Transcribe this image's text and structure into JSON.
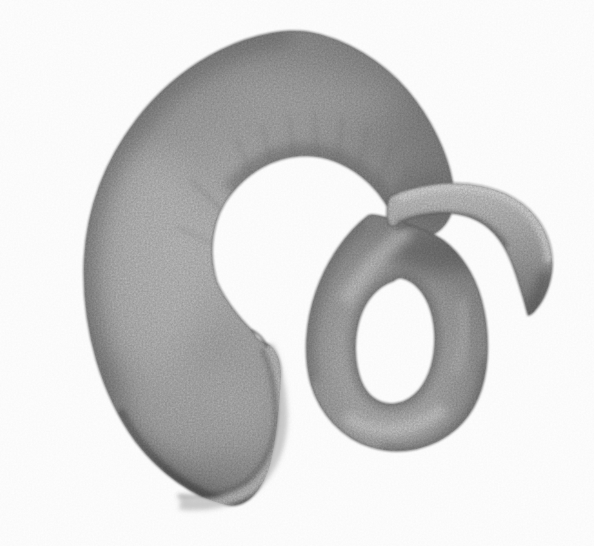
{
  "image": {
    "medium": "graphite pencil drawing on white paper",
    "subject": "Pencil drawing of a thick coiled horn-like shell: a large shaded C-shaped whorl with a flared aperture lip, tapering into a tube that makes one open loop and ends in a slender, downward-curving hooked tip",
    "alt": "Graphite drawing of a coiled horn-shaped tubular shell",
    "background": "#ffffff",
    "palette": {
      "paper": "#ffffff",
      "graphite_highlight": "#d9d9d9",
      "graphite_light": "#c2c2c2",
      "graphite_mid": "#9b9b9b",
      "graphite_shadow": "#6f6f6f",
      "graphite_dark": "#4a4a4a"
    },
    "canvas": {
      "width": 594,
      "height": 546
    }
  }
}
